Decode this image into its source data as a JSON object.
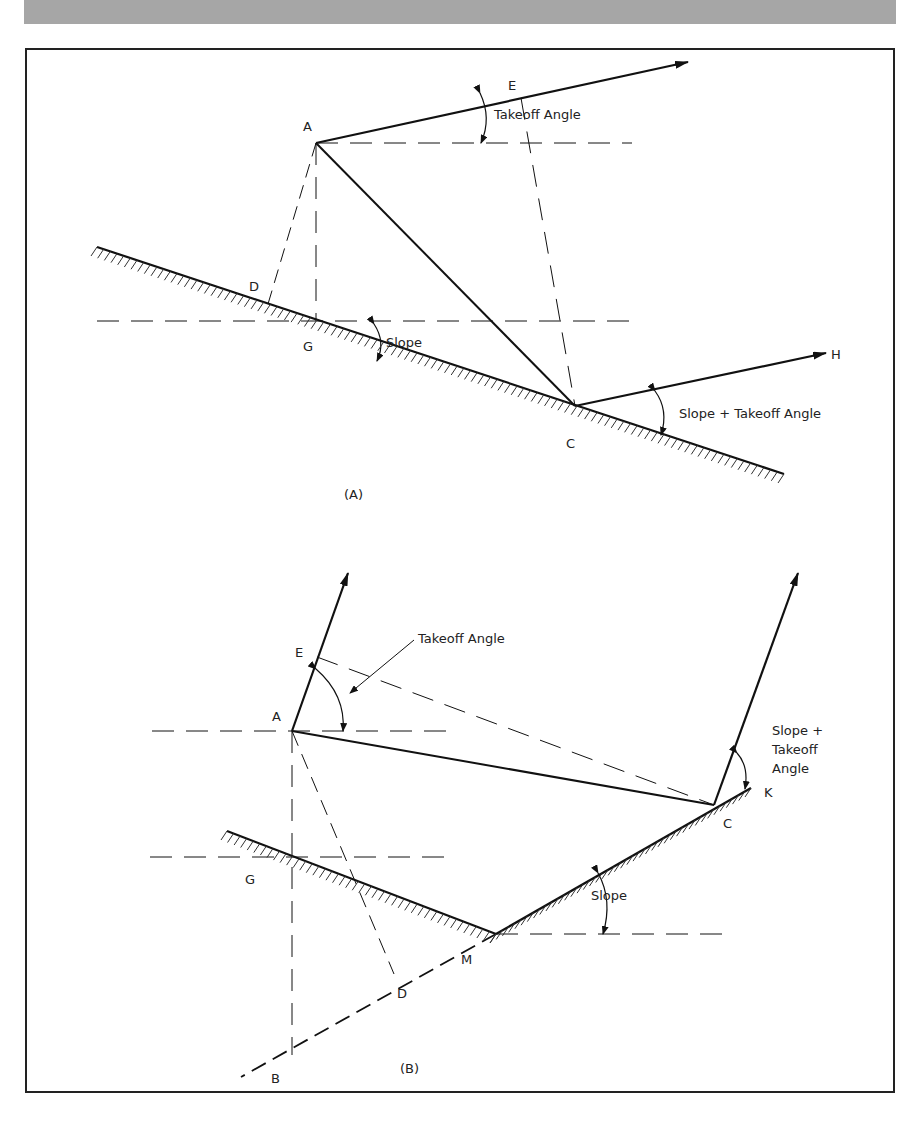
{
  "figure": {
    "panel_a": {
      "caption": "(A)",
      "points": {
        "A": "A",
        "C": "C",
        "D": "D",
        "E": "E",
        "G": "G",
        "H": "H"
      },
      "annotations": {
        "takeoff": "Takeoff Angle",
        "slope": "Slope",
        "slope_takeoff": "Slope + Takeoff Angle"
      }
    },
    "panel_b": {
      "caption": "(B)",
      "points": {
        "A": "A",
        "B": "B",
        "C": "C",
        "D": "D",
        "E": "E",
        "G": "G",
        "K": "K",
        "M": "M"
      },
      "annotations": {
        "takeoff": "Takeoff Angle",
        "slope": "Slope",
        "slope_takeoff_1": "Slope +",
        "slope_takeoff_2": "Takeoff",
        "slope_takeoff_3": "Angle"
      }
    }
  }
}
